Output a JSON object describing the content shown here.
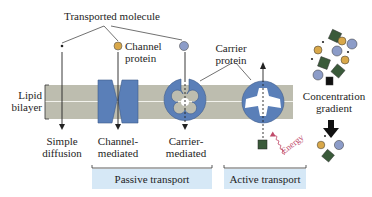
{
  "title": "Transported molecule",
  "labels": {
    "channel_protein": [
      "Channel",
      "protein"
    ],
    "carrier_protein": [
      "Carrier",
      "protein"
    ],
    "lipid_bilayer": [
      "Lipid",
      "bilayer"
    ],
    "simple_diffusion": [
      "Simple",
      "diffusion"
    ],
    "channel_mediated": [
      "Channel-",
      "mediated"
    ],
    "carrier_mediated": [
      "Carrier-",
      "mediated"
    ],
    "energy": "Energy",
    "concentration_gradient": [
      "Concentration",
      "gradient"
    ]
  },
  "groups": {
    "passive": "Passive transport",
    "active": "Active transport"
  },
  "colors": {
    "protein_blue": "#5a7fb8",
    "membrane": "#bdbdaf",
    "molecule_yellow": "#d9a84a",
    "molecule_blue": "#8c9cc8",
    "molecule_green": "#3a5a3a",
    "group_box": "#d6e8f6",
    "energy": "#c04a6a"
  }
}
